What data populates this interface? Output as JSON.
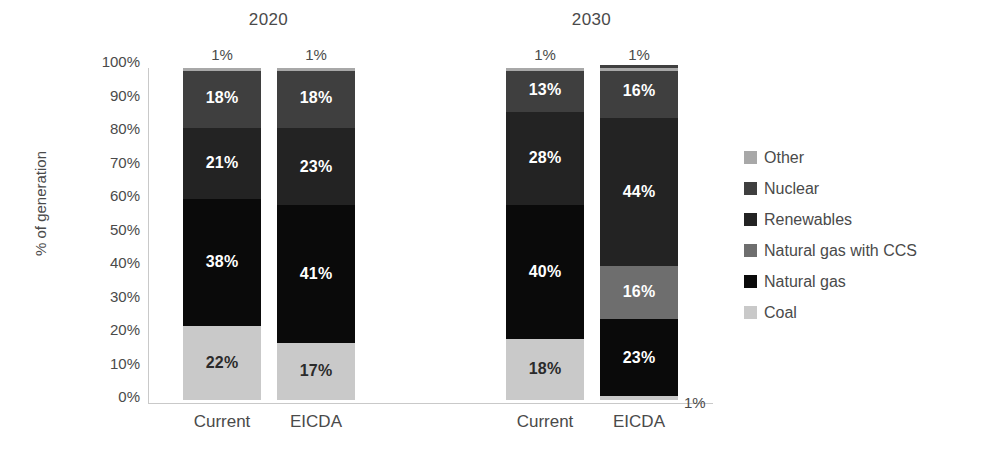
{
  "chart_data": {
    "type": "bar",
    "subtype": "stacked-bar-100",
    "title": "",
    "xlabel": "",
    "ylabel": "% of generation",
    "ylim": [
      0,
      100
    ],
    "ytick_labels": [
      "100%",
      "90%",
      "80%",
      "70%",
      "60%",
      "50%",
      "40%",
      "30%",
      "20%",
      "10%",
      "0%"
    ],
    "ytick_values": [
      100,
      90,
      80,
      70,
      60,
      50,
      40,
      30,
      20,
      10,
      0
    ],
    "grid": false,
    "legend_position": "right",
    "groups": [
      {
        "label": "2020",
        "categories": [
          "Current",
          "EICDA"
        ]
      },
      {
        "label": "2030",
        "categories": [
          "Current",
          "EICDA"
        ]
      }
    ],
    "categories": [
      "2020 Current",
      "2020 EICDA",
      "2030 Current",
      "2030 EICDA"
    ],
    "stack_order_bottom_to_top": [
      "Coal",
      "Natural gas",
      "Natural gas with CCS",
      "Renewables",
      "Nuclear",
      "Other"
    ],
    "series": [
      {
        "name": "Coal",
        "color": "#c9c9c9",
        "label_color": "dark",
        "values": [
          22,
          17,
          18,
          1
        ]
      },
      {
        "name": "Natural gas",
        "color": "#0a0a0a",
        "label_color": "light",
        "values": [
          38,
          41,
          40,
          23
        ]
      },
      {
        "name": "Natural gas with CCS",
        "color": "#6e6e6e",
        "label_color": "light",
        "values": [
          0,
          0,
          0,
          16
        ]
      },
      {
        "name": "Renewables",
        "color": "#232323",
        "label_color": "light",
        "values": [
          21,
          23,
          28,
          44
        ]
      },
      {
        "name": "Nuclear",
        "color": "#3f3f3f",
        "label_color": "light",
        "values": [
          18,
          18,
          13,
          16
        ]
      },
      {
        "name": "Other",
        "color": "#a8a8a8",
        "label_color": "dark",
        "values": [
          1,
          1,
          1,
          1
        ]
      }
    ],
    "legend": [
      {
        "label": "Other",
        "color": "#a8a8a8"
      },
      {
        "label": "Nuclear",
        "color": "#3f3f3f"
      },
      {
        "label": "Renewables",
        "color": "#232323"
      },
      {
        "label": "Natural gas with CCS",
        "color": "#6e6e6e"
      },
      {
        "label": "Natural gas",
        "color": "#0a0a0a"
      },
      {
        "label": "Coal",
        "color": "#c9c9c9"
      }
    ],
    "bars": [
      {
        "id": "2020-current",
        "group": "2020",
        "category": "Current",
        "top_label": "1%",
        "segments": [
          {
            "name": "Nuclear",
            "value": 18,
            "label": "18%"
          },
          {
            "name": "Renewables",
            "value": 21,
            "label": "21%"
          },
          {
            "name": "Natural gas",
            "value": 38,
            "label": "38%"
          },
          {
            "name": "Coal",
            "value": 22,
            "label": "22%"
          }
        ]
      },
      {
        "id": "2020-eicda",
        "group": "2020",
        "category": "EICDA",
        "top_label": "1%",
        "segments": [
          {
            "name": "Nuclear",
            "value": 18,
            "label": "18%"
          },
          {
            "name": "Renewables",
            "value": 23,
            "label": "23%"
          },
          {
            "name": "Natural gas",
            "value": 41,
            "label": "41%"
          },
          {
            "name": "Coal",
            "value": 17,
            "label": "17%"
          }
        ]
      },
      {
        "id": "2030-current",
        "group": "2030",
        "category": "Current",
        "top_label": "1%",
        "segments": [
          {
            "name": "Nuclear",
            "value": 13,
            "label": "13%"
          },
          {
            "name": "Renewables",
            "value": 28,
            "label": "28%"
          },
          {
            "name": "Natural gas",
            "value": 40,
            "label": "40%"
          },
          {
            "name": "Coal",
            "value": 18,
            "label": "18%"
          }
        ]
      },
      {
        "id": "2030-eicda",
        "group": "2030",
        "category": "EICDA",
        "top_label": "1%",
        "bottom_outside_label": "1%",
        "segments": [
          {
            "name": "Nuclear",
            "value": 16,
            "label": "16%"
          },
          {
            "name": "Renewables",
            "value": 44,
            "label": "44%"
          },
          {
            "name": "Natural gas with CCS",
            "value": 16,
            "label": "16%"
          },
          {
            "name": "Natural gas",
            "value": 23,
            "label": "23%"
          },
          {
            "name": "Coal",
            "value": 1,
            "label": ""
          }
        ]
      }
    ]
  },
  "axis": {
    "y_title": "% of generation"
  }
}
